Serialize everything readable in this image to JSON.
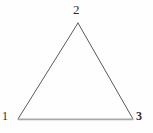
{
  "figure": {
    "type": "triangle-diagram",
    "background_color": "#fefefe",
    "canvas": {
      "width": 153,
      "height": 133
    },
    "vertices": [
      {
        "id": "1",
        "label": "1",
        "x": 18,
        "y": 119,
        "label_x": 2,
        "label_y": 110,
        "label_position": "left-below"
      },
      {
        "id": "2",
        "label": "2",
        "x": 78,
        "y": 23,
        "label_x": 73,
        "label_y": 3,
        "label_position": "above"
      },
      {
        "id": "3",
        "label": "3",
        "x": 133,
        "y": 119,
        "label_x": 136,
        "label_y": 110,
        "label_position": "right-below"
      }
    ],
    "edges": [
      {
        "id": "edge-1-2",
        "from": "1",
        "to": "2",
        "color": "#5a5a5a",
        "width": 1
      },
      {
        "id": "edge-2-3",
        "from": "2",
        "to": "3",
        "color": "#5a5a5a",
        "width": 1
      },
      {
        "id": "edge-3-1",
        "from": "3",
        "to": "1",
        "color": "#a8a8a8",
        "width": 1.6
      }
    ],
    "label_color": "#2e2e2e"
  }
}
